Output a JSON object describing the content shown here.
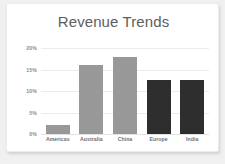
{
  "card": {
    "background": "#ffffff",
    "page_background": "#f0f0f0"
  },
  "chart_data": {
    "type": "bar",
    "title": "Revenue Trends",
    "xlabel": "",
    "ylabel": "",
    "categories": [
      "Americas",
      "Australia",
      "China",
      "Europe",
      "India"
    ],
    "values": [
      2,
      16,
      18,
      12.5,
      12.5
    ],
    "bar_colors": [
      "#989898",
      "#989898",
      "#989898",
      "#2e2e2e",
      "#2e2e2e"
    ],
    "ylim": [
      0,
      20
    ],
    "ytick_labels": [
      "20%",
      "15%",
      "10%",
      "5%",
      "0%"
    ],
    "ytick_values": [
      20,
      15,
      10,
      5,
      0
    ],
    "grid": true,
    "grid_color": "#ececec",
    "legend": false,
    "legend_position": "none",
    "title_color": "#5e5e5e",
    "tick_label_color": "#8c8c8c",
    "category_label_color": "#6f6f6f"
  }
}
